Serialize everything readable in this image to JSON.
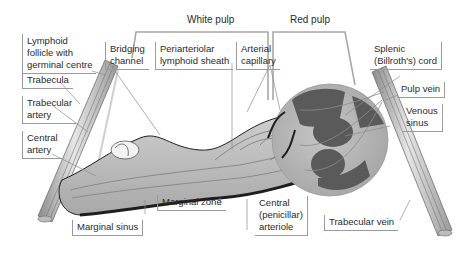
{
  "diagram": {
    "headers": {
      "white_pulp": "White pulp",
      "red_pulp": "Red pulp"
    },
    "labels": {
      "lymphoid_follicle": "Lymphoid\nfollicle with\ngerminal centre",
      "bridging_channel": "Bridging\nchannel",
      "periarteriolar_sheath": "Periarteriolar\nlymphoid sheath",
      "arterial_capillary": "Arterial\ncapillary",
      "splenic_cord": "Splenic\n(Billroth's) cord",
      "trabecula": "Trabecula",
      "trabecular_artery": "Trabecular\nartery",
      "central_artery": "Central\nartery",
      "pulp_vein": "Pulp vein",
      "venous_sinus": "Venous\nsinus",
      "marginal_sinus": "Marginal sinus",
      "marginal_zone": "Marginal zone",
      "central_arteriole": "Central\n(penicillar)\narteriole",
      "trabecular_vein": "Trabecular vein"
    },
    "colors": {
      "vessel": "#c8c8c8",
      "tissue": "#b9b9b9",
      "cord_dark": "#5a5a5a",
      "outline": "#1e1e1e",
      "leader": "#8c8c8c"
    }
  }
}
